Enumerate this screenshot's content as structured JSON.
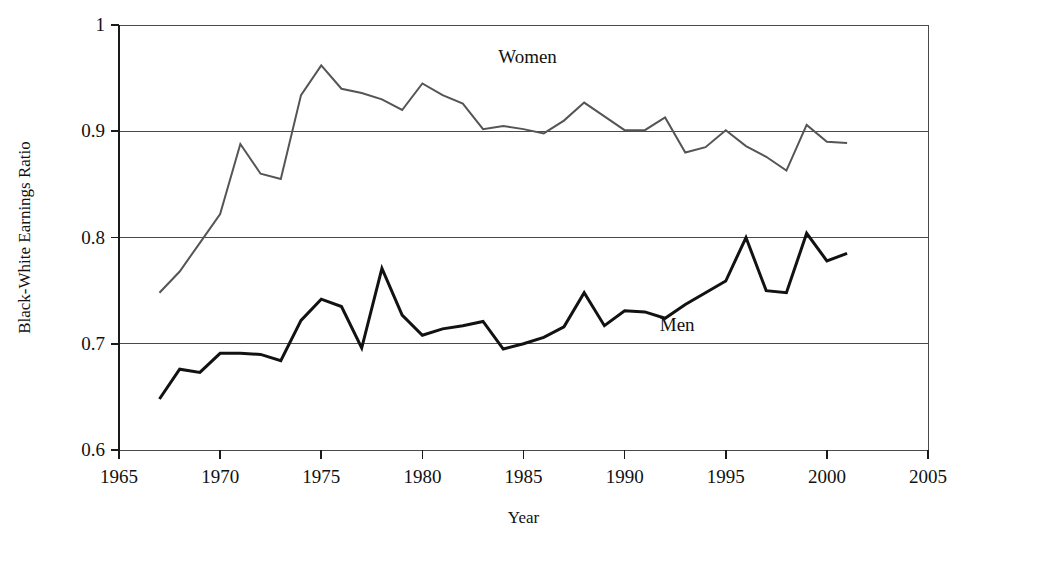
{
  "chart_data": {
    "type": "line",
    "title": "",
    "xlabel": "Year",
    "ylabel": "Black-White Earnings Ratio",
    "xlim": [
      1965,
      2005
    ],
    "ylim": [
      0.6,
      1.0
    ],
    "xticks": [
      "1965",
      "1970",
      "1975",
      "1980",
      "1985",
      "1990",
      "1995",
      "2000",
      "2005"
    ],
    "xtick_values": [
      1965,
      1970,
      1975,
      1980,
      1985,
      1990,
      1995,
      2000,
      2005
    ],
    "yticks": [
      "0.6",
      "0.7",
      "0.8",
      "0.9",
      "1"
    ],
    "ytick_values": [
      0.6,
      0.7,
      0.8,
      0.9,
      1.0
    ],
    "grid": "horizontal",
    "legend_position": "inline-annotations",
    "x": [
      1967,
      1968,
      1969,
      1970,
      1971,
      1972,
      1973,
      1974,
      1975,
      1976,
      1977,
      1978,
      1979,
      1980,
      1981,
      1982,
      1983,
      1984,
      1985,
      1986,
      1987,
      1988,
      1989,
      1990,
      1991,
      1992,
      1993,
      1994,
      1995,
      1996,
      1997,
      1998,
      1999,
      2000,
      2001
    ],
    "series": [
      {
        "name": "Women",
        "color": "#555555",
        "stroke_width": 2.0,
        "label_x": 1985.2,
        "label_y": 0.964,
        "values": [
          0.748,
          0.768,
          0.795,
          0.822,
          0.888,
          0.86,
          0.855,
          0.934,
          0.962,
          0.94,
          0.936,
          0.93,
          0.92,
          0.945,
          0.934,
          0.926,
          0.902,
          0.905,
          0.902,
          0.898,
          0.91,
          0.927,
          0.914,
          0.901,
          0.901,
          0.913,
          0.88,
          0.885,
          0.901,
          0.886,
          0.876,
          0.863,
          0.906,
          0.89,
          0.889
        ]
      },
      {
        "name": "Men",
        "color": "#121212",
        "stroke_width": 3.0,
        "label_x": 1992.6,
        "label_y": 0.712,
        "values": [
          0.648,
          0.676,
          0.673,
          0.691,
          0.691,
          0.69,
          0.684,
          0.722,
          0.742,
          0.735,
          0.696,
          0.771,
          0.727,
          0.708,
          0.714,
          0.717,
          0.721,
          0.695,
          0.7,
          0.706,
          0.716,
          0.748,
          0.717,
          0.731,
          0.73,
          0.724,
          0.737,
          0.748,
          0.759,
          0.8,
          0.75,
          0.748,
          0.804,
          0.778,
          0.785
        ]
      }
    ]
  },
  "plot_geometry": {
    "left": 119,
    "right": 928,
    "top": 25,
    "bottom": 450
  }
}
